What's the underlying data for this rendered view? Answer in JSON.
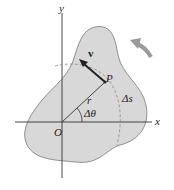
{
  "diagram": {
    "labels": {
      "y_axis": "y",
      "x_axis": "x",
      "origin": "O",
      "point": "P",
      "velocity": "v",
      "radius": "r",
      "angle": "Δθ",
      "arc": "Δs"
    },
    "colors": {
      "body_fill": "#d8d8d8",
      "outline": "#666666",
      "axes": "#333333",
      "rotation_arrow": "#9a9a9a"
    }
  }
}
